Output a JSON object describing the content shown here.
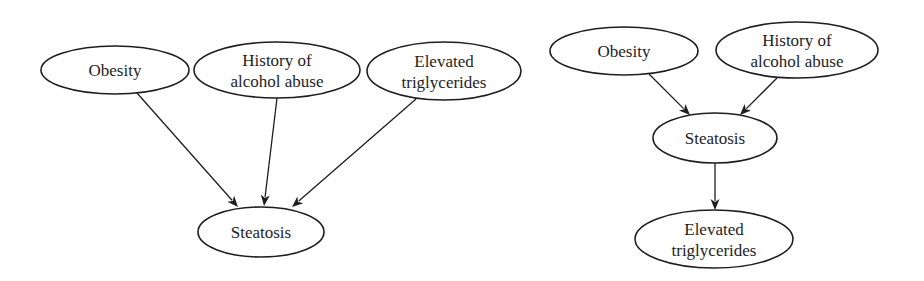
{
  "diagrams": [
    {
      "name": "left-graph",
      "description": "Three causes pointing to Steatosis",
      "nodes": [
        {
          "id": "obesity",
          "lines": [
            "Obesity"
          ],
          "cx": 115,
          "cy": 70,
          "rx": 74,
          "ry": 24
        },
        {
          "id": "alcohol",
          "lines": [
            "History of",
            "alcohol abuse"
          ],
          "cx": 277,
          "cy": 70,
          "rx": 83,
          "ry": 28
        },
        {
          "id": "triglycerides",
          "lines": [
            "Elevated",
            "triglycerides"
          ],
          "cx": 444,
          "cy": 71,
          "rx": 77,
          "ry": 29
        },
        {
          "id": "steatosis",
          "lines": [
            "Steatosis"
          ],
          "cx": 261,
          "cy": 232,
          "rx": 63,
          "ry": 25
        }
      ],
      "edges": [
        {
          "from": "obesity",
          "to": "steatosis",
          "x1": 137,
          "y1": 93,
          "x2": 238,
          "y2": 207
        },
        {
          "from": "alcohol",
          "to": "steatosis",
          "x1": 277,
          "y1": 98,
          "x2": 264,
          "y2": 206
        },
        {
          "from": "triglycerides",
          "to": "steatosis",
          "x1": 416,
          "y1": 99,
          "x2": 292,
          "y2": 207
        }
      ]
    },
    {
      "name": "right-graph",
      "description": "Two causes pointing to Steatosis, which points to Elevated triglycerides",
      "nodes": [
        {
          "id": "obesity",
          "lines": [
            "Obesity"
          ],
          "cx": 624,
          "cy": 51,
          "rx": 74,
          "ry": 24
        },
        {
          "id": "alcohol",
          "lines": [
            "History of",
            "alcohol abuse"
          ],
          "cx": 797,
          "cy": 50,
          "rx": 81,
          "ry": 28
        },
        {
          "id": "steatosis",
          "lines": [
            "Steatosis"
          ],
          "cx": 715,
          "cy": 138,
          "rx": 62,
          "ry": 25
        },
        {
          "id": "triglycerides",
          "lines": [
            "Elevated",
            "triglycerides"
          ],
          "cx": 714,
          "cy": 239,
          "rx": 79,
          "ry": 29
        }
      ],
      "edges": [
        {
          "from": "obesity",
          "to": "steatosis",
          "x1": 649,
          "y1": 74,
          "x2": 690,
          "y2": 115
        },
        {
          "from": "alcohol",
          "to": "steatosis",
          "x1": 777,
          "y1": 78,
          "x2": 740,
          "y2": 115
        },
        {
          "from": "steatosis",
          "to": "triglycerides",
          "x1": 715,
          "y1": 163,
          "x2": 715,
          "y2": 210
        }
      ]
    }
  ],
  "style": {
    "stroke_color": "#1e1e1e",
    "background": "#ffffff"
  }
}
